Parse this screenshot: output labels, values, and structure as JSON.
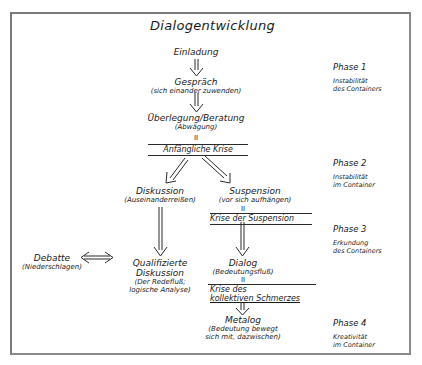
{
  "diagram": {
    "title": "Dialogentwicklung",
    "nodes": {
      "einladung": {
        "label": "Einladung"
      },
      "gespraech": {
        "label": "Gespräch",
        "sub": "(sich einander zuwenden)"
      },
      "ueberlegung": {
        "label": "Überlegung/Beratung",
        "sub": "(Abwägung)"
      },
      "diskussion": {
        "label": "Diskussion",
        "sub": "(Auseinanderreißen)"
      },
      "suspension": {
        "label": "Suspension",
        "sub": "(vor sich aufhängen)"
      },
      "debatte": {
        "label": "Debatte",
        "sub": "(Niederschlagen)"
      },
      "qualifizierte": {
        "label_line1": "Qualifizierte",
        "label_line2": "Diskussion",
        "sub_line1": "(Der Redefluß;",
        "sub_line2": "logische Analyse)"
      },
      "dialog": {
        "label": "Dialog",
        "sub": "(Bedeutungsfluß)"
      },
      "metalog": {
        "label": "Metalog",
        "sub_line1": "(Bedeutung bewegt",
        "sub_line2": "sich mit, dazwischen)"
      }
    },
    "crises": {
      "anfaengliche": "Anfängliche Krise",
      "suspension": "Krise der Suspension",
      "kollektiv_line1": "Krise des",
      "kollektiv_line2": "kollektiven Schmerzes"
    },
    "equals_mark": "II",
    "phases": [
      {
        "title": "Phase 1",
        "desc_line1": "Instabilität",
        "desc_line2": "des Containers"
      },
      {
        "title": "Phase 2",
        "desc_line1": "Instabilität",
        "desc_line2": "im Container"
      },
      {
        "title": "Phase 3",
        "desc_line1": "Erkundung",
        "desc_line2": "des Containers"
      },
      {
        "title": "Phase 4",
        "desc_line1": "Kreativität",
        "desc_line2": "im Container"
      }
    ],
    "colors": {
      "ink": "#1a1a1a",
      "frame": "#7a7a7a",
      "background": "#ffffff"
    }
  }
}
